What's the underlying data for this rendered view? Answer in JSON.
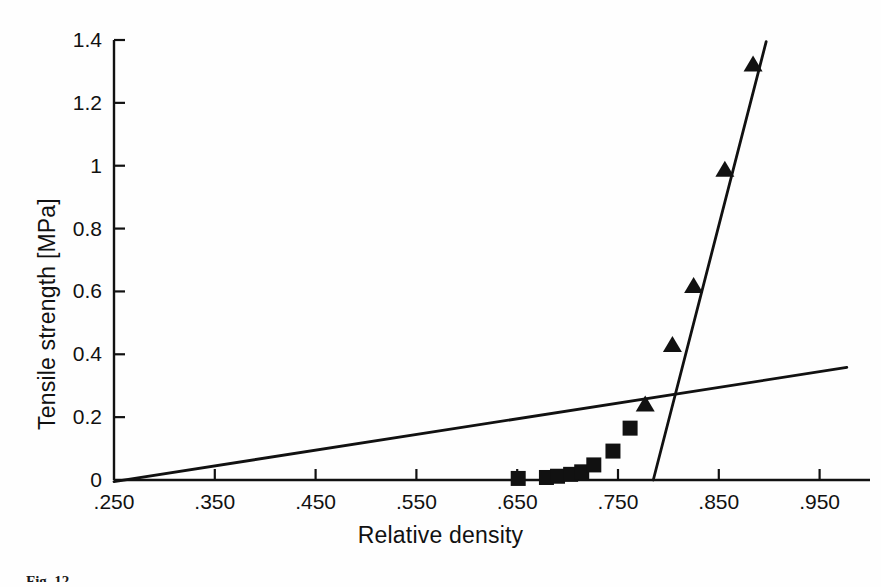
{
  "figure": {
    "caption": "Fig. 12",
    "background_color": "#fefefe",
    "ink_color": "#111111"
  },
  "chart_data": {
    "type": "scatter",
    "title": "",
    "subtitle": "",
    "xlabel": "Relative density",
    "ylabel": "Tensile strength [MPa]",
    "xlim": [
      0.25,
      1.0
    ],
    "ylim": [
      0,
      1.4
    ],
    "xtick_labels": [
      ".250",
      ".350",
      ".450",
      ".550",
      ".650",
      ".750",
      ".850",
      ".950"
    ],
    "xtick_values": [
      0.25,
      0.35,
      0.45,
      0.55,
      0.65,
      0.75,
      0.85,
      0.95
    ],
    "ytick_labels": [
      "0",
      "0.2",
      "0.4",
      "0.6",
      "0.8",
      "1",
      "1.2",
      "1.4"
    ],
    "ytick_values": [
      0,
      0.2,
      0.4,
      0.6,
      0.8,
      1.0,
      1.2,
      1.4
    ],
    "grid": false,
    "legend": "none",
    "series": [
      {
        "name": "square-markers",
        "marker": "square",
        "color": "#111111",
        "points": [
          {
            "x": 0.651,
            "y": 0.005
          },
          {
            "x": 0.679,
            "y": 0.008
          },
          {
            "x": 0.69,
            "y": 0.012
          },
          {
            "x": 0.703,
            "y": 0.018
          },
          {
            "x": 0.714,
            "y": 0.026
          },
          {
            "x": 0.726,
            "y": 0.048
          },
          {
            "x": 0.745,
            "y": 0.092
          },
          {
            "x": 0.762,
            "y": 0.165
          }
        ]
      },
      {
        "name": "triangle-markers",
        "marker": "triangle",
        "color": "#111111",
        "points": [
          {
            "x": 0.777,
            "y": 0.238
          },
          {
            "x": 0.804,
            "y": 0.428
          },
          {
            "x": 0.825,
            "y": 0.615
          },
          {
            "x": 0.856,
            "y": 0.985
          },
          {
            "x": 0.884,
            "y": 1.32
          }
        ]
      }
    ],
    "fit_lines": [
      {
        "name": "shallow-fit-line",
        "color": "#111111",
        "x_start": 0.25,
        "y_start": -0.005,
        "x_end": 0.977,
        "y_end": 0.358
      },
      {
        "name": "steep-fit-line",
        "color": "#111111",
        "x_start": 0.785,
        "y_start": 0.0,
        "x_end": 0.897,
        "y_end": 1.395
      }
    ]
  }
}
